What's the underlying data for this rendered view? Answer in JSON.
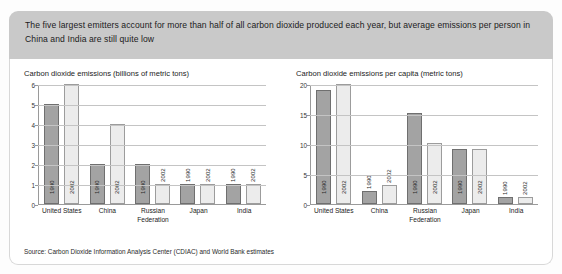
{
  "header": {
    "text": "The five largest emitters account for more than half of all carbon dioxide produced each year, but average emissions per person in China and India are still quite low"
  },
  "source": {
    "label": "Source: Carbon Dioxide Information Analysis Center (CDIAC) and World Bank estimates"
  },
  "series_labels": {
    "a": "1990",
    "b": "2002"
  },
  "chart_data": [
    {
      "type": "bar",
      "title": "Carbon dioxide emissions (billions of metric tons)",
      "xlabel": "",
      "ylabel": "",
      "ylim": [
        0,
        6
      ],
      "yticks": [
        0,
        1,
        2,
        3,
        4,
        5,
        6
      ],
      "grid": true,
      "legend": "none",
      "categories": [
        "United States",
        "China",
        "Russian Federation",
        "Japan",
        "India"
      ],
      "series": [
        {
          "name": "1990",
          "values": [
            5.0,
            2.0,
            2.0,
            1.0,
            1.0
          ]
        },
        {
          "name": "2002",
          "values": [
            6.0,
            4.0,
            1.0,
            1.0,
            1.0
          ]
        }
      ]
    },
    {
      "type": "bar",
      "title": "Carbon dioxide emissions per capita (metric tons)",
      "xlabel": "",
      "ylabel": "",
      "ylim": [
        0,
        20
      ],
      "yticks": [
        0,
        5,
        10,
        15,
        20
      ],
      "grid": true,
      "legend": "none",
      "categories": [
        "United States",
        "China",
        "Russian Federation",
        "Japan",
        "India"
      ],
      "series": [
        {
          "name": "1990",
          "values": [
            19.0,
            2.1,
            15.1,
            9.2,
            1.1
          ]
        },
        {
          "name": "2002",
          "values": [
            20.0,
            3.2,
            10.1,
            9.2,
            1.1
          ]
        }
      ]
    }
  ],
  "colors": {
    "banner": "#c9c9c9",
    "bar_1990_fill": "#a3a3a3",
    "bar_1990_stroke": "#6f6f6f",
    "bar_2002_fill": "#ececec",
    "bar_2002_stroke": "#9c9c9c",
    "gridline": "#c4c4c4",
    "axis": "#9a9a9a"
  }
}
